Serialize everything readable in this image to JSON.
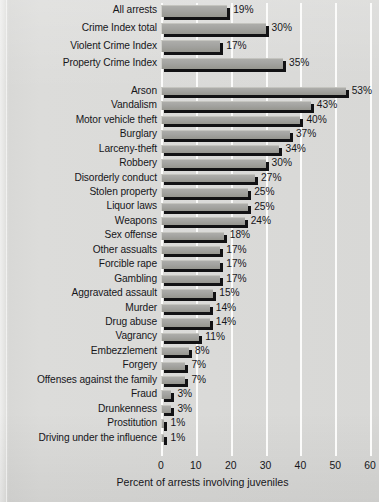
{
  "chart_data": {
    "type": "bar",
    "orientation": "horizontal",
    "title": "",
    "xlabel": "Percent of arrests involving juveniles",
    "ylabel": "",
    "xlim": [
      0,
      60
    ],
    "xticks": [
      0,
      10,
      20,
      30,
      40,
      50,
      60
    ],
    "xtick_labels": [
      "0",
      "10",
      "20",
      "30",
      "40",
      "50",
      "60"
    ],
    "grid": "vertical-white-gridlines",
    "legend": "none",
    "value_label_suffix": "%",
    "groups": [
      {
        "name": "summary",
        "categories": [
          "All arrests",
          "Crime Index total",
          "Violent Crime Index",
          "Property Crime Index"
        ],
        "values": [
          19,
          30,
          17,
          35
        ],
        "value_labels": [
          "19%",
          "30%",
          "17%",
          "35%"
        ]
      },
      {
        "name": "offenses",
        "categories": [
          "Arson",
          "Vandalism",
          "Motor vehicle theft",
          "Burglary",
          "Larceny-theft",
          "Robbery",
          "Disorderly conduct",
          "Stolen property",
          "Liquor laws",
          "Weapons",
          "Sex offense",
          "Other assualts",
          "Forcible rape",
          "Gambling",
          "Aggravated assault",
          "Murder",
          "Drug abuse",
          "Vagrancy",
          "Embezzlement",
          "Forgery",
          "Offenses against the family",
          "Fraud",
          "Drunkenness",
          "Prostitution",
          "Driving under the influence"
        ],
        "values": [
          53,
          43,
          40,
          37,
          34,
          30,
          27,
          25,
          25,
          24,
          18,
          17,
          17,
          17,
          15,
          14,
          14,
          11,
          8,
          7,
          7,
          3,
          3,
          1,
          1
        ],
        "value_labels": [
          "53%",
          "43%",
          "40%",
          "37%",
          "34%",
          "30%",
          "27%",
          "25%",
          "25%",
          "24%",
          "18%",
          "17%",
          "17%",
          "17%",
          "15%",
          "14%",
          "14%",
          "11%",
          "8%",
          "7%",
          "7%",
          "3%",
          "3%",
          "1%",
          "1%"
        ]
      }
    ],
    "colors": {
      "bar_fill": "#a3a3a0",
      "bar_shadow": "#121214",
      "gridline": "#fbfbfa",
      "background": "#d8d8d6",
      "text": "#16161a"
    }
  }
}
